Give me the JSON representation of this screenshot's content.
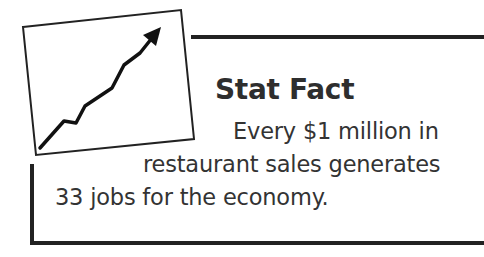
{
  "callout": {
    "title": "Stat Fact",
    "body_lines": [
      "Every $1 million in",
      "restaurant sales generates",
      "33 jobs for the economy."
    ],
    "icon": "rising-trend-chart-icon",
    "colors": {
      "text": "#333333",
      "rules": "#222222",
      "background": "#ffffff"
    }
  }
}
